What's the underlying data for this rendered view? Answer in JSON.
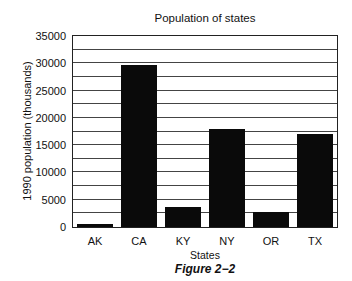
{
  "chart_data": {
    "type": "bar",
    "title": "Population of states",
    "xlabel": "States",
    "ylabel": "1990 population (thousands)",
    "categories": [
      "AK",
      "CA",
      "KY",
      "NY",
      "OR",
      "TX"
    ],
    "values": [
      550,
      29760,
      3685,
      17990,
      2842,
      16987
    ],
    "ylim": [
      0,
      35000
    ],
    "yticks": [
      0,
      5000,
      10000,
      15000,
      20000,
      25000,
      30000,
      35000
    ],
    "gridlines_every": 2500,
    "grid": true,
    "legend": null,
    "bar_color": "#0a0a0a",
    "caption": "Figure 2−2"
  }
}
